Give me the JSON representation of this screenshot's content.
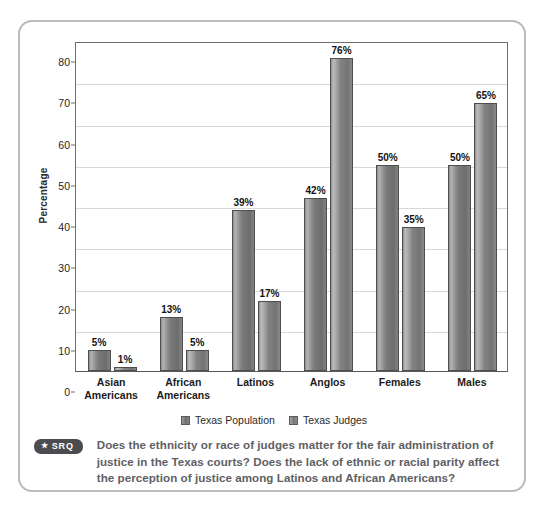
{
  "chart_data": {
    "type": "bar",
    "title": "",
    "xlabel": "",
    "ylabel": "Percentage",
    "ylim": [
      0,
      80
    ],
    "yticks": [
      0,
      10,
      20,
      30,
      40,
      50,
      60,
      70,
      80
    ],
    "grid": true,
    "legend_position": "bottom-center",
    "categories": [
      "Asian Americans",
      "African Americans",
      "Latinos",
      "Anglos",
      "Females",
      "Males"
    ],
    "category_lines": [
      [
        "Asian",
        "Americans"
      ],
      [
        "African",
        "Americans"
      ],
      [
        "Latinos",
        ""
      ],
      [
        "Anglos",
        ""
      ],
      [
        "Females",
        ""
      ],
      [
        "Males",
        ""
      ]
    ],
    "series": [
      {
        "name": "Texas Population",
        "values": [
          5,
          13,
          39,
          42,
          50,
          50
        ],
        "labels": [
          "5%",
          "13%",
          "39%",
          "42%",
          "50%",
          "50%"
        ],
        "color": "#7c7c7c"
      },
      {
        "name": "Texas Judges",
        "values": [
          1,
          5,
          17,
          76,
          35,
          65
        ],
        "labels": [
          "1%",
          "5%",
          "17%",
          "76%",
          "35%",
          "65%"
        ],
        "color": "#828282"
      }
    ]
  },
  "legend": {
    "items": [
      {
        "label": "Texas Population"
      },
      {
        "label": "Texas Judges"
      }
    ]
  },
  "srq": {
    "badge_star": "★",
    "badge_label": "SRQ",
    "text": "Does the ethnicity or race of judges matter for the fair administration of justice in the Texas courts? Does the lack of ethnic or racial parity affect the perception of justice among Latinos and African Americans?"
  },
  "colors": {
    "card_border": "#b9bbbd",
    "axis": "#6e6e6e",
    "gridline": "#d8d8d8",
    "badge_bg": "#4c4c50",
    "note_text": "#5e6064"
  }
}
